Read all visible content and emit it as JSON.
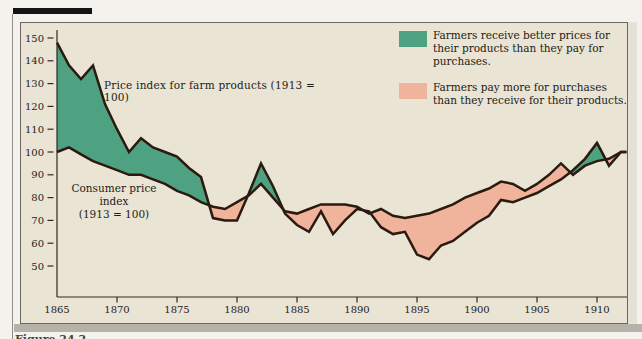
{
  "page": {
    "caption_partial": "Figure 24.2"
  },
  "legend": {
    "items": [
      {
        "color": "#4ea282",
        "label": "Farmers receive better prices for their products than they pay for purchases."
      },
      {
        "color": "#f0b39c",
        "label": "Farmers pay more for purchases than they receive for their products."
      }
    ]
  },
  "annotations": {
    "farm_label": "Price index for farm products (1913 = 100)",
    "consumer_label_line1": "Consumer price index",
    "consumer_label_line2": "(1913 = 100)"
  },
  "chart_data": {
    "type": "area",
    "title": "",
    "xlabel": "",
    "ylabel": "",
    "x": [
      1865,
      1866,
      1867,
      1868,
      1869,
      1870,
      1871,
      1872,
      1873,
      1874,
      1875,
      1876,
      1877,
      1878,
      1879,
      1880,
      1881,
      1882,
      1883,
      1884,
      1885,
      1886,
      1887,
      1888,
      1889,
      1890,
      1891,
      1892,
      1893,
      1894,
      1895,
      1896,
      1897,
      1898,
      1899,
      1900,
      1901,
      1902,
      1903,
      1904,
      1905,
      1906,
      1907,
      1908,
      1909,
      1910,
      1911,
      1912
    ],
    "series": [
      {
        "name": "Price index for farm products (1913 = 100)",
        "values": [
          148,
          138,
          132,
          138,
          121,
          110,
          100,
          106,
          102,
          100,
          98,
          93,
          89,
          71,
          70,
          70,
          82,
          95,
          85,
          73,
          68,
          65,
          74,
          64,
          70,
          75,
          74,
          67,
          64,
          65,
          55,
          53,
          59,
          61,
          65,
          69,
          72,
          79,
          78,
          80,
          82,
          85,
          88,
          92,
          97,
          104,
          94,
          100
        ]
      },
      {
        "name": "Consumer price index (1913 = 100)",
        "values": [
          100,
          102,
          99,
          96,
          94,
          92,
          90,
          90,
          88,
          86,
          83,
          81,
          78,
          76,
          75,
          78,
          81,
          86,
          80,
          74,
          73,
          75,
          77,
          77,
          77,
          76,
          73,
          75,
          72,
          71,
          72,
          73,
          75,
          77,
          80,
          82,
          84,
          87,
          86,
          83,
          86,
          90,
          95,
          90,
          94,
          96,
          97,
          100
        ]
      }
    ],
    "fill_rules": [
      {
        "where": "farm_index > consumer_index",
        "color": "#4ea282",
        "meaning": "Farmers receive better prices for their products than they pay for purchases."
      },
      {
        "where": "consumer_index > farm_index",
        "color": "#f0b39c",
        "meaning": "Farmers pay more for purchases than they receive for their products."
      }
    ],
    "xticks": [
      1865,
      1870,
      1875,
      1880,
      1885,
      1890,
      1895,
      1900,
      1905,
      1910
    ],
    "yticks": [
      150,
      140,
      130,
      120,
      110,
      100,
      90,
      80,
      70,
      60,
      50
    ],
    "xlim": [
      1865,
      1912.5
    ],
    "ylim": [
      50,
      155
    ],
    "grid": false,
    "legend_position": "top-right",
    "line_color": "#2b1a10",
    "background": "#e9e4d4"
  }
}
